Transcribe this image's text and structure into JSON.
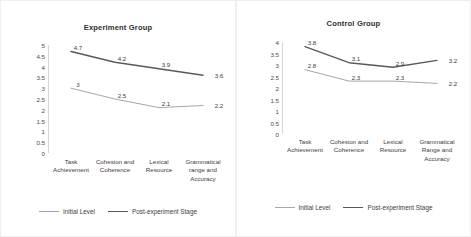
{
  "chart_data": [
    {
      "type": "line",
      "title": "Experiment Group",
      "xlabel": "",
      "ylabel": "",
      "ylim": [
        0,
        5
      ],
      "yticks": [
        "5",
        "4.5",
        "4",
        "3.5",
        "3",
        "2.5",
        "2",
        "1.5",
        "1",
        "0.5",
        "0"
      ],
      "grid": false,
      "legend_position": "bottom",
      "categories": [
        "Task Achievement",
        "Cohesion and Coherence",
        "Lexical Resource",
        "Grammatical range and Accuracy"
      ],
      "series": [
        {
          "name": "Initial Level",
          "color": "#a6a6a6",
          "values": [
            3,
            2.5,
            2.1,
            2.2
          ],
          "labels": [
            "3",
            "2.5",
            "2.1",
            "2.2"
          ]
        },
        {
          "name": "Post-experiment Stage",
          "color": "#595959",
          "values": [
            4.7,
            4.2,
            3.9,
            3.6
          ],
          "labels": [
            "4.7",
            "4.2",
            "3.9",
            "3.6"
          ]
        }
      ]
    },
    {
      "type": "line",
      "title": "Control Group",
      "xlabel": "",
      "ylabel": "",
      "ylim": [
        0,
        4
      ],
      "yticks": [
        "4",
        "3.5",
        "3",
        "2.5",
        "2",
        "1.5",
        "1",
        "0.5",
        "0"
      ],
      "grid": false,
      "legend_position": "bottom",
      "categories": [
        "Task Achievement",
        "Cohesion and Coherence",
        "Lexical Resource",
        "Grammatical Range and Accuracy"
      ],
      "series": [
        {
          "name": "Initial Level",
          "color": "#a6a6a6",
          "values": [
            2.8,
            2.3,
            2.3,
            2.2
          ],
          "labels": [
            "2.8",
            "2.3",
            "2.3",
            "2.2"
          ]
        },
        {
          "name": "Post-experiment Stage",
          "color": "#595959",
          "values": [
            3.8,
            3.1,
            2.9,
            3.2
          ],
          "labels": [
            "3.8",
            "3.1",
            "2.9",
            "3.2"
          ]
        }
      ]
    }
  ]
}
